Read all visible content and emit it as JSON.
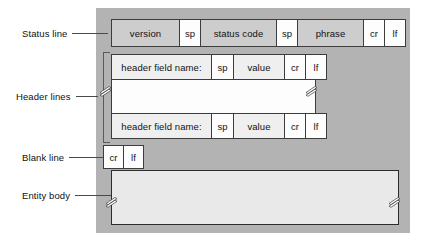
{
  "figure": {
    "background_color": "#b3b3b3",
    "labels": {
      "status_line": "Status line",
      "header_lines": "Header lines",
      "blank_line": "Blank line",
      "entity_body": "Entity body"
    },
    "status_line": {
      "cells": [
        {
          "text": "version",
          "fill": "gray"
        },
        {
          "text": "sp",
          "fill": "white"
        },
        {
          "text": "status code",
          "fill": "gray"
        },
        {
          "text": "sp",
          "fill": "white"
        },
        {
          "text": "phrase",
          "fill": "gray"
        },
        {
          "text": "cr",
          "fill": "white"
        },
        {
          "text": "lf",
          "fill": "white"
        }
      ]
    },
    "header_line_1": {
      "cells": [
        {
          "text": "header field name:",
          "fill": "pale"
        },
        {
          "text": "sp",
          "fill": "white"
        },
        {
          "text": "value",
          "fill": "pale"
        },
        {
          "text": "cr",
          "fill": "white"
        },
        {
          "text": "lf",
          "fill": "white"
        }
      ]
    },
    "header_line_2": {
      "cells": [
        {
          "text": "header field name:",
          "fill": "pale"
        },
        {
          "text": "sp",
          "fill": "white"
        },
        {
          "text": "value",
          "fill": "pale"
        },
        {
          "text": "cr",
          "fill": "white"
        },
        {
          "text": "lf",
          "fill": "white"
        }
      ]
    },
    "blank_line": {
      "cells": [
        {
          "text": "cr",
          "fill": "white"
        },
        {
          "text": "lf",
          "fill": "white"
        }
      ]
    },
    "entity_body": {
      "text": "",
      "fill": "#e9e9e9"
    },
    "break_marks": {
      "count": 4,
      "description": "double-slash continuation marks"
    }
  }
}
